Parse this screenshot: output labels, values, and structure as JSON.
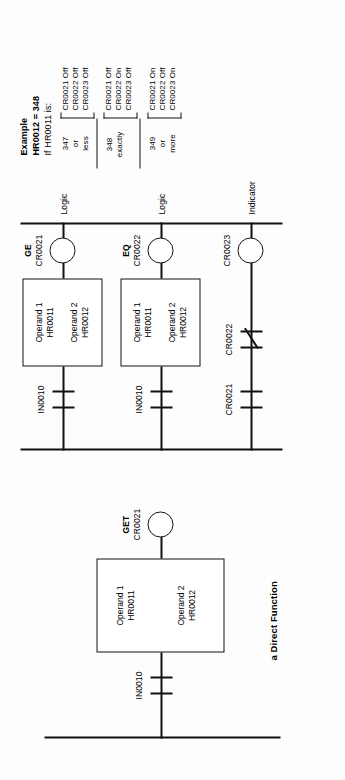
{
  "diagram": {
    "title": "a Direct Function",
    "rungs": [
      {
        "id": "rung-get",
        "input_label": "IN0010",
        "instruction": "GET",
        "coil_label": "CR0021",
        "operand1_name": "Operand 1",
        "operand1_value": "HR0011",
        "operand2_name": "Operand 2",
        "operand2_value": "HR0012"
      },
      {
        "id": "rung-ge",
        "input_label": "IN0010",
        "instruction": "GE",
        "coil_label": "CR0021",
        "coil_type": "Logic",
        "operand1_name": "Operand 1",
        "operand1_value": "HR0011",
        "operand2_name": "Operand 2",
        "operand2_value": "HR0012"
      },
      {
        "id": "rung-eq",
        "input_label": "IN0010",
        "instruction": "EQ",
        "coil_label": "CR0022",
        "coil_type": "Logic",
        "operand1_name": "Operand 1",
        "operand1_value": "HR0011",
        "operand2_name": "Operand 2",
        "operand2_value": "HR0012"
      },
      {
        "id": "rung-indicator",
        "contact1_label": "CR0021",
        "contact2_label": "CR0022",
        "coil_label": "CR0023",
        "coil_type": "Indicator"
      }
    ]
  },
  "example": {
    "heading": "Example",
    "line1": "HR0012 = 348",
    "line2": "If HR0011 is:",
    "cases": [
      {
        "condition_top": "347",
        "condition_mid": "or",
        "condition_bot": "less",
        "results": [
          "CR0021 Off",
          "CR0022 Off",
          "CR0023 Off"
        ]
      },
      {
        "condition_top": "348",
        "condition_mid": "exactly",
        "condition_bot": "",
        "results": [
          "CR0021 Off",
          "CR0022 On",
          "CR0023 Off"
        ]
      },
      {
        "condition_top": "349",
        "condition_mid": "or",
        "condition_bot": "more",
        "results": [
          "CR0021 On",
          "CR0022 Off",
          "CR0023 On"
        ]
      }
    ]
  }
}
